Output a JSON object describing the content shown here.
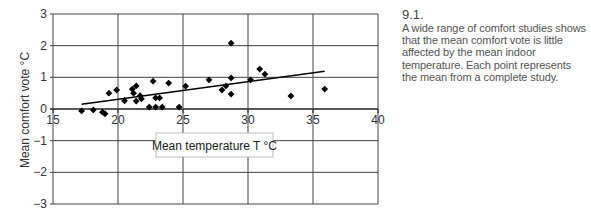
{
  "figure": {
    "number": "9.1.",
    "caption": "A wide range of comfort studies shows that the mean comfort vote is little affected by the mean indoor temperature. Each point represents the mean from a complete study."
  },
  "chart_data": {
    "type": "scatter",
    "title": "",
    "xlabel": "Mean temperature T °C",
    "ylabel": "Mean comfort vote °C",
    "xlim": [
      15,
      40
    ],
    "ylim": [
      -3,
      3
    ],
    "x_ticks": [
      15,
      20,
      25,
      30,
      35,
      40
    ],
    "y_ticks": [
      3,
      2,
      1,
      0,
      -1,
      -2,
      -3
    ],
    "grid": true,
    "series": [
      {
        "name": "Study means",
        "marker": "diamond",
        "color": "#000000",
        "points": [
          [
            17.2,
            -0.06
          ],
          [
            18.1,
            -0.03
          ],
          [
            18.8,
            -0.1
          ],
          [
            19.0,
            -0.15
          ],
          [
            19.3,
            0.5
          ],
          [
            19.9,
            0.6
          ],
          [
            20.5,
            0.26
          ],
          [
            21.1,
            0.63
          ],
          [
            21.2,
            0.5
          ],
          [
            21.4,
            0.73
          ],
          [
            21.4,
            0.25
          ],
          [
            21.7,
            0.42
          ],
          [
            21.8,
            0.32
          ],
          [
            22.7,
            0.88
          ],
          [
            22.4,
            0.06
          ],
          [
            22.9,
            0.35
          ],
          [
            23.2,
            0.35
          ],
          [
            22.9,
            0.06
          ],
          [
            23.4,
            0.06
          ],
          [
            23.9,
            0.82
          ],
          [
            24.7,
            0.06
          ],
          [
            25.2,
            0.72
          ],
          [
            27.0,
            0.92
          ],
          [
            28.7,
            2.08
          ],
          [
            28.7,
            0.98
          ],
          [
            28.3,
            0.73
          ],
          [
            28.0,
            0.6
          ],
          [
            28.7,
            0.47
          ],
          [
            30.2,
            0.92
          ],
          [
            30.9,
            1.26
          ],
          [
            31.3,
            1.1
          ],
          [
            33.3,
            0.41
          ],
          [
            35.9,
            0.63
          ]
        ]
      }
    ],
    "trendline": {
      "x": [
        17.2,
        35.9
      ],
      "y": [
        0.15,
        1.19
      ],
      "color": "#000000"
    },
    "annotations": [
      {
        "text": "Mean temperature T °C",
        "boxed": true,
        "x": 25.5,
        "y": -1.2
      }
    ]
  }
}
